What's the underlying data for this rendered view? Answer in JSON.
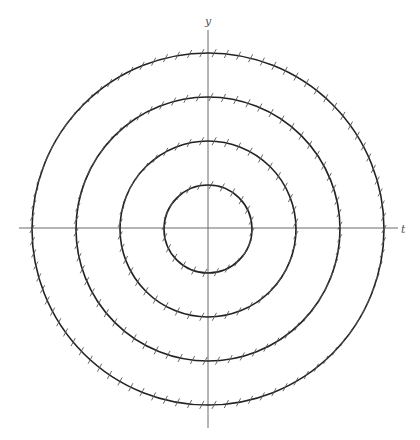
{
  "diagram": {
    "axes": {
      "x_label": "t",
      "y_label": "y",
      "origin": [
        208,
        229
      ],
      "x_axis": {
        "from": 19,
        "to": 398,
        "y": 228
      },
      "y_axis": {
        "from": 30,
        "to": 428,
        "x": 208
      }
    },
    "circles": [
      {
        "id": "circle-1",
        "radius": 44,
        "tick_count": 24
      },
      {
        "id": "circle-2",
        "radius": 88,
        "tick_count": 44
      },
      {
        "id": "circle-3",
        "radius": 132,
        "tick_count": 66
      },
      {
        "id": "circle-4",
        "radius": 176,
        "tick_count": 90
      }
    ],
    "tick_marks": {
      "length": 9,
      "angle_deg": 62,
      "color": "#555555"
    },
    "colors": {
      "circle": "#222222",
      "axis": "#6b6b6b",
      "background": "#ffffff"
    }
  }
}
